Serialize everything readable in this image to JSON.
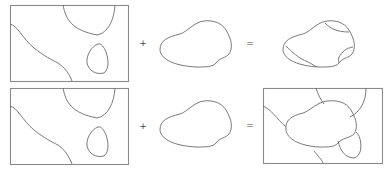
{
  "figure": {
    "colors": {
      "stroke": "#6a6a6a",
      "frame": "#8a8a8a",
      "background": "#ffffff"
    },
    "rows": [
      {
        "id": "row-1",
        "operand_plus": "+",
        "operand_equals": "=",
        "result": "shape clipped by map regions (no frame)"
      },
      {
        "id": "row-2",
        "operand_plus": "+",
        "operand_equals": "=",
        "result": "shape overlaid on map regions (with frame)"
      }
    ]
  }
}
